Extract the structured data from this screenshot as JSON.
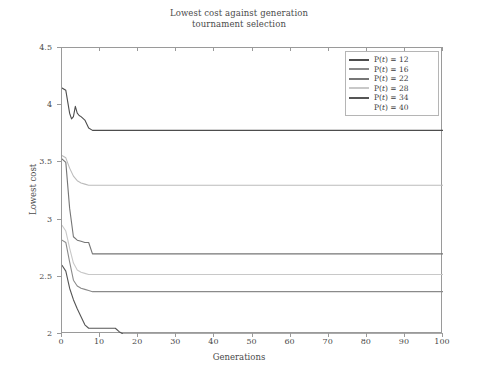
{
  "chart_data": {
    "type": "line",
    "title": "Lowest cost against generation",
    "subtitle": "tournament selection",
    "xlabel": "Generations",
    "ylabel": "Lowest cost",
    "xlim": [
      0,
      100
    ],
    "ylim": [
      2,
      4.5
    ],
    "xticks": [
      0,
      10,
      20,
      30,
      40,
      50,
      60,
      70,
      80,
      90,
      100
    ],
    "yticks": [
      2,
      2.5,
      3,
      3.5,
      4,
      4.5
    ],
    "grid": false,
    "legend_position": "top-right",
    "series": [
      {
        "name": "P(t) = 12",
        "color": "#4d4d4d",
        "plateau": 3.78,
        "x": [
          0,
          1,
          2,
          2.5,
          3,
          3.5,
          4,
          4.5,
          5,
          6,
          7,
          8,
          9,
          10,
          20,
          40,
          60,
          80,
          100
        ],
        "values": [
          4.15,
          4.13,
          3.93,
          3.88,
          3.9,
          3.99,
          3.93,
          3.91,
          3.9,
          3.87,
          3.8,
          3.78,
          3.78,
          3.78,
          3.78,
          3.78,
          3.78,
          3.78,
          3.78
        ]
      },
      {
        "name": "P(t) = 16",
        "color": "#8a8a8a",
        "plateau": 2.37,
        "x": [
          0,
          1,
          2,
          3,
          4,
          5,
          6,
          7,
          8,
          10,
          20,
          40,
          60,
          80,
          100
        ],
        "values": [
          2.82,
          2.8,
          2.63,
          2.47,
          2.42,
          2.4,
          2.39,
          2.38,
          2.37,
          2.37,
          2.37,
          2.37,
          2.37,
          2.37,
          2.37
        ]
      },
      {
        "name": "P(t) = 22",
        "color": "#767676",
        "plateau": 2.7,
        "x": [
          0,
          1,
          2,
          3,
          4,
          5,
          6,
          7,
          8,
          9,
          10,
          20,
          40,
          60,
          80,
          100
        ],
        "values": [
          3.53,
          3.5,
          3.1,
          2.85,
          2.82,
          2.81,
          2.8,
          2.8,
          2.7,
          2.7,
          2.7,
          2.7,
          2.7,
          2.7,
          2.7,
          2.7
        ]
      },
      {
        "name": "P(t) = 28",
        "color": "#c8c8c8",
        "plateau": 2.52,
        "x": [
          0,
          1,
          2,
          3,
          4,
          5,
          6,
          7,
          8,
          10,
          20,
          40,
          60,
          80,
          100
        ],
        "values": [
          2.95,
          2.9,
          2.75,
          2.62,
          2.56,
          2.54,
          2.53,
          2.52,
          2.52,
          2.52,
          2.52,
          2.52,
          2.52,
          2.52,
          2.52
        ]
      },
      {
        "name": "P(t) = 34",
        "color": "#555555",
        "plateau": 2.0,
        "x": [
          0,
          1,
          2,
          3,
          4,
          5,
          6,
          7,
          8,
          10,
          12,
          14,
          15,
          16,
          20,
          40,
          60,
          80,
          100
        ],
        "values": [
          2.6,
          2.55,
          2.4,
          2.3,
          2.22,
          2.15,
          2.08,
          2.05,
          2.05,
          2.05,
          2.05,
          2.05,
          2.02,
          2.0,
          2.0,
          2.0,
          2.0,
          2.0,
          2.0
        ]
      },
      {
        "name": "P(t) = 40",
        "color": "#bcbcbc",
        "plateau": 3.3,
        "x": [
          0,
          1,
          2,
          3,
          4,
          5,
          6,
          7,
          8,
          10,
          20,
          40,
          60,
          80,
          100
        ],
        "values": [
          3.56,
          3.54,
          3.45,
          3.38,
          3.34,
          3.32,
          3.31,
          3.3,
          3.3,
          3.3,
          3.3,
          3.3,
          3.3,
          3.3,
          3.3
        ]
      }
    ]
  },
  "legend": {
    "items": [
      {
        "label": "P(t) = 12",
        "prefix": "P(",
        "var": "t",
        "suffix": ") = 12",
        "color": "#4d4d4d"
      },
      {
        "label": "P(t) = 16",
        "prefix": "P(",
        "var": "t",
        "suffix": ") = 16",
        "color": "#8a8a8a"
      },
      {
        "label": "P(t) = 22",
        "prefix": "P(",
        "var": "t",
        "suffix": ") = 22",
        "color": "#767676"
      },
      {
        "label": "P(t) = 28",
        "prefix": "P(",
        "var": "t",
        "suffix": ") = 28",
        "color": "#c8c8c8"
      },
      {
        "label": "P(t) = 34",
        "prefix": "P(",
        "var": "t",
        "suffix": ") = 34",
        "color": "#555555"
      },
      {
        "label": "P(t) = 40",
        "prefix": "P(",
        "var": "t",
        "suffix": ") = 40",
        "color": "#d8d8d8"
      }
    ]
  }
}
